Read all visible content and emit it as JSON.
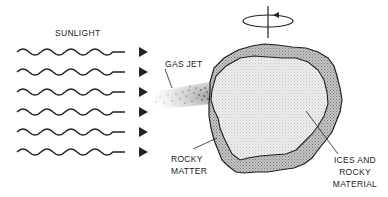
{
  "diagram": {
    "labels": {
      "sunlight": "SUNLIGHT",
      "gas_jet": "GAS JET",
      "rocky_matter_line1": "ROCKY",
      "rocky_matter_line2": "MATTER",
      "ices_line1": "ICES AND",
      "ices_line2": "ROCKY",
      "ices_line3": "MATERIAL"
    },
    "sunlight_rays": {
      "count": 6,
      "y_positions": [
        52,
        72,
        92,
        112,
        132,
        152
      ],
      "x_start": 17,
      "x_end": 148
    },
    "rotation_indicator": "counter-clockwise rotation arrow around vertical axis",
    "colors": {
      "stroke": "#222222",
      "outer_crust": "#b5b5b5",
      "inner_core": "#e6e6e6",
      "background": "#ffffff"
    }
  }
}
